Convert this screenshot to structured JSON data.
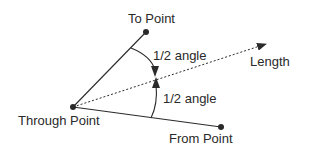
{
  "diagram": {
    "labels": {
      "to_point": "To Point",
      "from_point": "From Point",
      "through_point": "Through Point",
      "length": "Length",
      "half_angle_upper": "1/2 angle",
      "half_angle_lower": "1/2  angle"
    },
    "colors": {
      "line": "#2a2a2a",
      "text": "#2a2a2a",
      "background": "#ffffff"
    },
    "points": {
      "through": [
        73,
        107
      ],
      "to": [
        146,
        32
      ],
      "from": [
        221,
        127
      ],
      "length_tip": [
        266,
        44
      ]
    }
  }
}
